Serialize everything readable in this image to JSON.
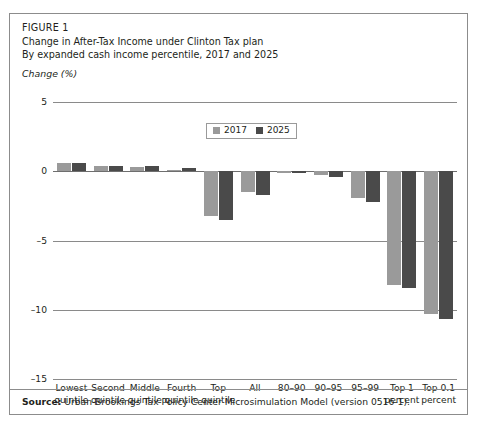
{
  "figure": {
    "label": "FIGURE 1",
    "title_line1": "Change in After-Tax Income under Clinton Tax plan",
    "title_line2": "By expanded cash income percentile, 2017 and 2025",
    "axis_unit": "Change (%)"
  },
  "source": {
    "prefix": "Source:",
    "text": " Urban-Brookings Tax Policy Center Microsimulation Model (version 0516-1)."
  },
  "legend": {
    "position": "top-center-inside",
    "entries": [
      {
        "label": "2017",
        "color": "#9a9a9a"
      },
      {
        "label": "2025",
        "color": "#4a4a4a"
      }
    ]
  },
  "colors": {
    "series_2017": "#9a9a9a",
    "series_2025": "#4a4a4a",
    "gridline": "#8a8a8a",
    "border": "#8c8c8c",
    "text": "#231f20"
  },
  "chart_data": {
    "type": "bar",
    "title": "Change in After-Tax Income under Clinton Tax plan",
    "subtitle": "By expanded cash income percentile, 2017 and 2025",
    "xlabel": "",
    "ylabel": "Change (%)",
    "ylim": [
      -15,
      5
    ],
    "yticks": [
      5,
      0,
      -5,
      -10,
      -15
    ],
    "ytick_labels": [
      "5",
      "0",
      "-5",
      "-10",
      "-15"
    ],
    "grid": true,
    "legend_position": "top-center",
    "categories": [
      "Lowest quintile",
      "Second quintile",
      "Middle quintile",
      "Fourth quintile",
      "Top quintile",
      "All",
      "80-90",
      "90-95",
      "95-99",
      "Top 1 percent",
      "Top 0.1 percent"
    ],
    "category_lines": [
      [
        "Lowest",
        "quintile"
      ],
      [
        "Second",
        "quintile"
      ],
      [
        "Middle",
        "quintile"
      ],
      [
        "Fourth",
        "quintile"
      ],
      [
        "Top",
        "quintile"
      ],
      [
        "All",
        ""
      ],
      [
        "80-90",
        ""
      ],
      [
        "90-95",
        ""
      ],
      [
        "95-99",
        ""
      ],
      [
        "Top 1",
        "percent"
      ],
      [
        "Top 0.1",
        "percent"
      ]
    ],
    "series": [
      {
        "name": "2017",
        "color": "#9a9a9a",
        "values": [
          0.6,
          0.4,
          0.3,
          0.1,
          -3.2,
          -1.5,
          0.0,
          -0.3,
          -1.9,
          -8.2,
          -10.3
        ]
      },
      {
        "name": "2025",
        "color": "#4a4a4a",
        "values": [
          0.6,
          0.4,
          0.4,
          0.2,
          -3.5,
          -1.7,
          -0.1,
          -0.4,
          -2.2,
          -8.4,
          -10.7
        ]
      }
    ]
  }
}
